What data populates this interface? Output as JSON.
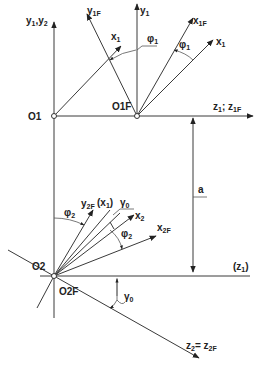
{
  "diagram": {
    "type": "coordinate-frame-transformation",
    "origins": {
      "o1": "O1",
      "o1f": "O1F",
      "o2": "O2",
      "o2f": "O2F"
    },
    "axes": {
      "y1_y2": {
        "main": "y",
        "sub1": "1",
        "sep": ",",
        "main2": "y",
        "sub2": "2"
      },
      "y1f": {
        "main": "y",
        "sub": "1F"
      },
      "x1_top": {
        "main": "x",
        "sub": "1"
      },
      "y1": {
        "main": "y",
        "sub": "1"
      },
      "x1f": {
        "main": "x",
        "sub": "1F"
      },
      "x1_right": {
        "main": "x",
        "sub": "1"
      },
      "z1_z1f": {
        "main": "z",
        "sub": "1",
        "sep": "; ",
        "main2": "z",
        "sub2": "1F"
      },
      "y2f": {
        "main": "y",
        "sub": "2F"
      },
      "x1_paren": {
        "open": "(",
        "main": "x",
        "sub": "1",
        "close": ")"
      },
      "y0": {
        "main": "γ",
        "sub": "0"
      },
      "x2": {
        "main": "x",
        "sub": "2"
      },
      "x2f": {
        "main": "x",
        "sub": "2F"
      },
      "z1_paren": {
        "open": "(",
        "main": "z",
        "sub": "1",
        "close": ")"
      },
      "z2_z2f": {
        "main": "z",
        "sub": "2",
        "sep": "= ",
        "main2": "z",
        "sub2": "2F"
      }
    },
    "angles": {
      "phi1_top": {
        "main": "φ",
        "sub": "1"
      },
      "phi1_right": {
        "main": "φ",
        "sub": "1"
      },
      "phi2_left": {
        "main": "φ",
        "sub": "2"
      },
      "phi2_right": {
        "main": "φ",
        "sub": "2"
      },
      "gamma0": {
        "main": "γ",
        "sub": "0"
      }
    },
    "dimension": {
      "label": "a"
    },
    "colors": {
      "line": "#3a3a3a",
      "text": "#222222",
      "background": "#ffffff"
    }
  }
}
